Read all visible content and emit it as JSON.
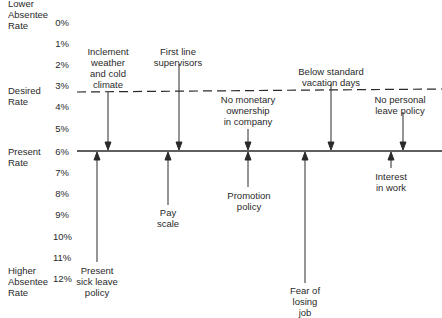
{
  "diagram": {
    "type": "force-field-analysis",
    "side_labels": {
      "top": [
        "Lower",
        "Absentee",
        "Rate"
      ],
      "desired": [
        "Desired",
        "Rate"
      ],
      "present": [
        "Present",
        "Rate"
      ],
      "bottom": [
        "Higher",
        "Absentee",
        "Rate"
      ]
    },
    "scale_ticks": [
      "0%",
      "1%",
      "2%",
      "3%",
      "4%",
      "5%",
      "6%",
      "7%",
      "8%",
      "9%",
      "10%",
      "11%",
      "12%"
    ],
    "desired_rate": "3%",
    "present_rate": "6%",
    "restraining_forces": [
      {
        "label": [
          "Inclement",
          "weather",
          "and cold",
          "climate"
        ],
        "x": 108
      },
      {
        "label": [
          "First line",
          "supervisors"
        ],
        "x": 179
      },
      {
        "label": [
          "No monetary",
          "ownership",
          "in company"
        ],
        "x": 248
      },
      {
        "label": [
          "Below standard",
          "vacation days"
        ],
        "x": 331
      },
      {
        "label": [
          "No personal",
          "leave policy"
        ],
        "x": 403
      }
    ],
    "driving_forces": [
      {
        "label": [
          "Present",
          "sick leave",
          "policy"
        ],
        "x": 97
      },
      {
        "label": [
          "Pay",
          "scale"
        ],
        "x": 168
      },
      {
        "label": [
          "Promotion",
          "policy"
        ],
        "x": 248
      },
      {
        "label": [
          "Fear of",
          "losing",
          "job"
        ],
        "x": 305
      },
      {
        "label": [
          "Interest",
          "in work"
        ],
        "x": 391
      }
    ],
    "colors": {
      "ink": "#2a2a2a",
      "background": "#ffffff"
    }
  }
}
